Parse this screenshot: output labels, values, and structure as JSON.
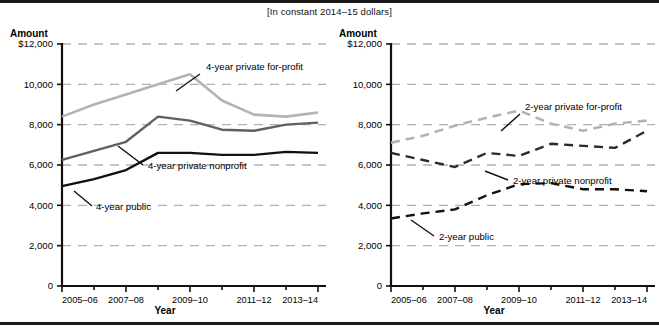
{
  "figure": {
    "subtitle": "[In constant 2014–15 dollars]",
    "amount_axis_title": "Amount",
    "year_axis_title": "Year"
  },
  "panels": [
    {
      "id": "left",
      "amount_title": "Amount",
      "year_title": "Year",
      "yticks": [
        "$12,000",
        "10,000",
        "8,000",
        "6,000",
        "4,000",
        "2,000",
        "0"
      ],
      "xticks": [
        "2005–06",
        "2007–08",
        "2009–10",
        "2011–12",
        "2013–14"
      ],
      "labels": [
        {
          "text": "4-year private for-profit",
          "series": "4-year private for-profit"
        },
        {
          "text": "4-year private nonprofit",
          "series": "4-year private nonprofit"
        },
        {
          "text": "4-year public",
          "series": "4-year public"
        }
      ]
    },
    {
      "id": "right",
      "amount_title": "Amount",
      "year_title": "Year",
      "yticks": [
        "$12,000",
        "10,000",
        "8,000",
        "6,000",
        "4,000",
        "2,000",
        "0"
      ],
      "xticks": [
        "2005–06",
        "2007–08",
        "2009–10",
        "2011–12",
        "2013–14"
      ],
      "labels": [
        {
          "text": "2-year private for-profit",
          "series": "2-year private for-profit"
        },
        {
          "text": "2-year private nonprofit",
          "series": "2-year private nonprofit"
        },
        {
          "text": "2-year public",
          "series": "2-year public"
        }
      ]
    }
  ],
  "chart_data": [
    {
      "type": "line",
      "panel": "left",
      "title": "",
      "subtitle": "[In constant 2014–15 dollars]",
      "xlabel": "Year",
      "ylabel": "Amount",
      "ylim": [
        0,
        12000
      ],
      "yticks": [
        0,
        2000,
        4000,
        6000,
        8000,
        10000,
        12000
      ],
      "ytick_labels": [
        "0",
        "2,000",
        "4,000",
        "6,000",
        "8,000",
        "10,000",
        "$12,000"
      ],
      "grid": true,
      "grid_style": "dashed-horizontal",
      "legend": "inline-annotations",
      "x": [
        "2005–06",
        "2006–07",
        "2007–08",
        "2008–09",
        "2009–10",
        "2010–11",
        "2011–12",
        "2012–13",
        "2013–14"
      ],
      "xtick_labels": [
        "2005–06",
        "2007–08",
        "2009–10",
        "2011–12",
        "2013–14"
      ],
      "series": [
        {
          "name": "4-year private for-profit",
          "color": "#b3b3b3",
          "dash": "solid",
          "values": [
            8400,
            9000,
            9500,
            10000,
            10500,
            9200,
            8500,
            8400,
            8600
          ]
        },
        {
          "name": "4-year private nonprofit",
          "color": "#606060",
          "dash": "solid",
          "values": [
            6250,
            6700,
            7150,
            8400,
            8200,
            7750,
            7700,
            8000,
            8100
          ]
        },
        {
          "name": "4-year public",
          "color": "#111111",
          "dash": "solid",
          "values": [
            4950,
            5300,
            5750,
            6600,
            6600,
            6500,
            6500,
            6650,
            6600
          ]
        }
      ]
    },
    {
      "type": "line",
      "panel": "right",
      "title": "",
      "subtitle": "[In constant 2014–15 dollars]",
      "xlabel": "Year",
      "ylabel": "Amount",
      "ylim": [
        0,
        12000
      ],
      "yticks": [
        0,
        2000,
        4000,
        6000,
        8000,
        10000,
        12000
      ],
      "ytick_labels": [
        "0",
        "2,000",
        "4,000",
        "6,000",
        "8,000",
        "10,000",
        "$12,000"
      ],
      "grid": true,
      "grid_style": "dashed-horizontal",
      "legend": "inline-annotations",
      "x": [
        "2005–06",
        "2006–07",
        "2007–08",
        "2008–09",
        "2009–10",
        "2010–11",
        "2011–12",
        "2012–13",
        "2013–14"
      ],
      "xtick_labels": [
        "2005–06",
        "2007–08",
        "2009–10",
        "2011–12",
        "2013–14"
      ],
      "series": [
        {
          "name": "2-year private for-profit",
          "color": "#b3b3b3",
          "dash": "dashed",
          "values": [
            7100,
            7450,
            7950,
            8350,
            8700,
            8050,
            7700,
            8050,
            8200
          ]
        },
        {
          "name": "2-year private nonprofit",
          "color": "#2b2b2b",
          "dash": "dashed",
          "values": [
            6600,
            6250,
            5900,
            6600,
            6450,
            7050,
            6950,
            6850,
            7700
          ]
        },
        {
          "name": "2-year public",
          "color": "#111111",
          "dash": "dashed",
          "values": [
            3350,
            3600,
            3800,
            4500,
            5050,
            5100,
            4800,
            4800,
            4700
          ]
        }
      ]
    }
  ]
}
